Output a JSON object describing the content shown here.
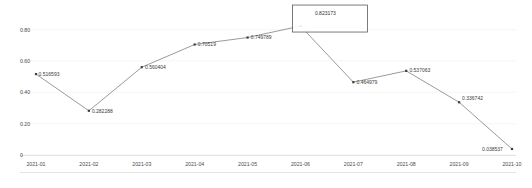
{
  "chart_data": {
    "type": "line",
    "title": "",
    "subtitle": "",
    "xlabel": "",
    "ylabel": "",
    "grid": true,
    "legend": "none",
    "categories": [
      "2021-01",
      "2021-02",
      "2021-03",
      "2021-04",
      "2021-05",
      "2021-06",
      "2021-07",
      "2021-08",
      "2021-09",
      "2021-10"
    ],
    "values": [
      0.516593,
      0.282288,
      0.560404,
      0.70519,
      0.749789,
      0.823173,
      0.464979,
      0.537063,
      0.336742,
      0.038537
    ],
    "point_labels": [
      "0.516593",
      "0.282288",
      "0.560404",
      "0.70519",
      "0.749789",
      "0.823173",
      "0.464979",
      "0.537063",
      "0.336742",
      "0.038537"
    ],
    "ylim": [
      0,
      0.9
    ],
    "yticks": [
      0,
      0.2,
      0.4,
      0.6,
      0.8
    ],
    "ytick_labels": [
      "0",
      "0.20",
      "0.40",
      "0.60",
      "0.80"
    ],
    "highlighted_index": 5,
    "highlight_label": "0.823173",
    "colors": {
      "line": "#6e6e6e",
      "marker": "#3c3c3c",
      "grid": "#f0f0f0",
      "axis": "#d8d8d8",
      "text": "#4a4a4a",
      "highlight_border": "#5a5a5a",
      "background": "#ffffff"
    }
  }
}
